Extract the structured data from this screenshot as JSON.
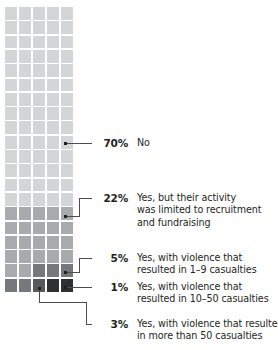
{
  "chart_data": {
    "type": "waffle",
    "title": "",
    "total_cells": 100,
    "grid": {
      "columns": 5,
      "rows": 20,
      "fill_order": "top-left to bottom-right, lightest first"
    },
    "categories": [
      "No",
      "Yes, but their activity was limited to recruitment and fundraising",
      "Yes, with violence that resulted in 1–9 casualties",
      "Yes, with violence that resulted in 10–50 casualties",
      "Yes, with violence that resulted in more than 50 casualties"
    ],
    "values": [
      70,
      22,
      5,
      1,
      3
    ],
    "value_labels": [
      "70%",
      "22%",
      "5%",
      "1%",
      "3%"
    ],
    "colors": [
      "#d3d5d6",
      "#a8abad",
      "#76797c",
      "#58595b",
      "#2f3032"
    ],
    "legend_position": "right",
    "grid_lines": "white gaps between cells"
  },
  "segments": [
    {
      "id": "no",
      "percent": "70%",
      "color": "#d3d5d6",
      "cells": 70,
      "lines": [
        "No"
      ]
    },
    {
      "id": "recruitment",
      "percent": "22%",
      "color": "#a8abad",
      "cells": 22,
      "lines": [
        "Yes, but their activity",
        "was limited to recruitment",
        "and fundraising"
      ]
    },
    {
      "id": "violence-1-9",
      "percent": "5%",
      "color": "#76797c",
      "cells": 5,
      "lines": [
        "Yes, with violence that",
        "resulted in 1–9 casualties"
      ]
    },
    {
      "id": "violence-10-50",
      "percent": "1%",
      "color": "#58595b",
      "cells": 1,
      "lines": [
        "Yes, with violence that",
        "resulted in 10–50 casualties"
      ]
    },
    {
      "id": "violence-50-plus",
      "percent": "3%",
      "color": "#2f3032",
      "cells": 3,
      "lines": [
        "Yes, with violence that resulted",
        "in more than 50 casualties"
      ]
    }
  ],
  "style": {
    "background": "#ffffff",
    "text_color": "#231f20",
    "leader_color": "#4d4d4f"
  }
}
